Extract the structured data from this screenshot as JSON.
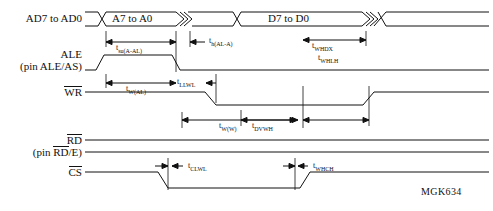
{
  "diagram": {
    "id_code": "MGK634",
    "signals": [
      {
        "name": "signal-ad-bus",
        "label": "AD7 to AD0",
        "overbar": false
      },
      {
        "name": "signal-ale",
        "label": "ALE",
        "sub": "(pin ALE/AS)",
        "overbar": false
      },
      {
        "name": "signal-wr",
        "label": "WR",
        "overbar": true
      },
      {
        "name": "signal-rd",
        "label": "RD",
        "sub": "(pin RD/E)",
        "overbar": true
      },
      {
        "name": "signal-cs",
        "label": "CS",
        "overbar": true
      }
    ],
    "bus_values": [
      {
        "name": "bus-address",
        "label": "A7 to A0"
      },
      {
        "name": "bus-data",
        "label": "D7 to D0"
      }
    ],
    "timing_params": [
      {
        "name": "t-su-a-al",
        "base": "t",
        "sub": "su(A-AL)"
      },
      {
        "name": "t-h-al-a",
        "base": "t",
        "sub": "h(AL-A)"
      },
      {
        "name": "t-w-al",
        "base": "t",
        "sub": "W(AL)"
      },
      {
        "name": "t-llwl",
        "base": "t",
        "sub": "LLWL"
      },
      {
        "name": "t-dvwh",
        "base": "t",
        "sub": "DVWH"
      },
      {
        "name": "t-whdx",
        "base": "t",
        "sub": "WHDX"
      },
      {
        "name": "t-whlh",
        "base": "t",
        "sub": "WHLH"
      },
      {
        "name": "t-w-w",
        "base": "t",
        "sub": "W(W)"
      },
      {
        "name": "t-clwl",
        "base": "t",
        "sub": "CLWL"
      },
      {
        "name": "t-whch",
        "base": "t",
        "sub": "WHCH"
      }
    ],
    "colors": {
      "line": "#111111",
      "background": "#ffffff",
      "text": "#111111"
    }
  }
}
